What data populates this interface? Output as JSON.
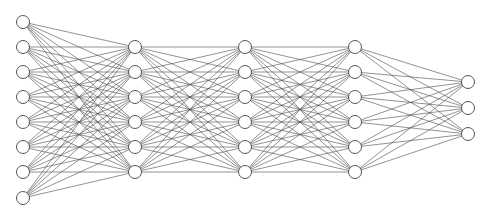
{
  "figure": {
    "width": 485,
    "height": 218,
    "background_color": "#ffffff"
  },
  "style": {
    "edge_color": "#4a4a4a",
    "edge_width": 0.6,
    "node_fill": "#ffffff",
    "node_stroke": "#555555",
    "node_stroke_width": 1,
    "node_radius": 6.5
  },
  "chart_data": {
    "type": "diagram",
    "diagram_kind": "neural-network",
    "layer_sizes": [
      8,
      6,
      6,
      6,
      3
    ],
    "total_nodes": 29,
    "total_edges": 186,
    "connectivity": "fully-connected between adjacent layers",
    "layers": [
      {
        "name": "input-layer",
        "index": 0,
        "node_count": 8,
        "x": 23,
        "node_y": [
          22,
          47,
          72,
          97,
          122,
          147,
          172,
          198
        ]
      },
      {
        "name": "hidden-layer-1",
        "index": 1,
        "node_count": 6,
        "x": 135,
        "node_y": [
          47,
          72,
          97,
          122,
          147,
          172
        ]
      },
      {
        "name": "hidden-layer-2",
        "index": 2,
        "node_count": 6,
        "x": 245,
        "node_y": [
          47,
          72,
          97,
          122,
          147,
          172
        ]
      },
      {
        "name": "hidden-layer-3",
        "index": 3,
        "node_count": 6,
        "x": 355,
        "node_y": [
          47,
          72,
          97,
          122,
          147,
          172
        ]
      },
      {
        "name": "output-layer",
        "index": 4,
        "node_count": 3,
        "x": 468,
        "node_y": [
          82,
          108,
          134
        ]
      }
    ],
    "edge_counts_between_layers": [
      48,
      36,
      36,
      36,
      18
    ],
    "xlabel": "",
    "ylabel": "",
    "legend": [],
    "annotations": []
  }
}
